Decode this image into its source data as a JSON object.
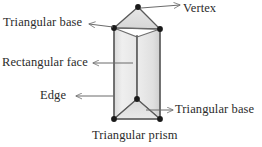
{
  "figure": {
    "caption": "Triangular prism",
    "shape_name": "triangular prism",
    "background_color": "#ffffff",
    "ink_color": "#2b2b2b"
  },
  "labels": {
    "vertex": "Vertex",
    "triangular_base_top": "Triangular base",
    "rectangular_face": "Rectangular face",
    "edge": "Edge",
    "triangular_base_bottom": "Triangular base"
  },
  "annotations": [
    {
      "name": "vertex",
      "text": "Vertex",
      "arrow_direction": "right",
      "points_to": "apex-vertex"
    },
    {
      "name": "triangular-base-top",
      "text": "Triangular base",
      "arrow_direction": "left",
      "points_to": "top-triangular-face"
    },
    {
      "name": "rectangular-face",
      "text": "Rectangular face",
      "arrow_direction": "left",
      "points_to": "front-rectangular-face"
    },
    {
      "name": "edge",
      "text": "Edge",
      "arrow_direction": "left",
      "points_to": "left-vertical-edge"
    },
    {
      "name": "triangular-base-bottom",
      "text": "Triangular base",
      "arrow_direction": "right",
      "points_to": "bottom-triangular-face"
    }
  ],
  "geometry": {
    "apex": {
      "x": 138,
      "y": 7
    },
    "top_left": {
      "x": 114,
      "y": 28
    },
    "top_right": {
      "x": 160,
      "y": 29
    },
    "front_mid": {
      "x": 137,
      "y": 99
    },
    "bottom_left": {
      "x": 114,
      "y": 119
    },
    "bottom_right": {
      "x": 160,
      "y": 119
    },
    "face_fill_light": "#f2f2f2",
    "face_fill_mid": "#e2e2e2",
    "face_fill_dark": "#d2d2d2",
    "stroke_color": "#555555",
    "vertex_dot_color": "#1a1a1a"
  }
}
